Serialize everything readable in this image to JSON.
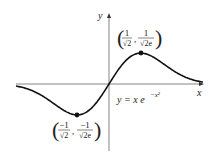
{
  "figure": {
    "equation": {
      "lhs": "y = x e",
      "exponent": "−x²"
    },
    "axes": {
      "x_label": "x",
      "y_label": "y"
    },
    "points": [
      {
        "name": "maximum",
        "x_num": "1",
        "x_den": "√2",
        "y_num": "1",
        "y_den": "√2e",
        "coords": "(1/√2, 1/√(2e))"
      },
      {
        "name": "minimum",
        "x_num": "−1",
        "x_den": "√2",
        "y_num": "−1",
        "y_den": "√2e",
        "coords": "(−1/√2, −1/√(2e))"
      }
    ],
    "colors": {
      "curve": "#111111",
      "axes": "#555555"
    }
  }
}
